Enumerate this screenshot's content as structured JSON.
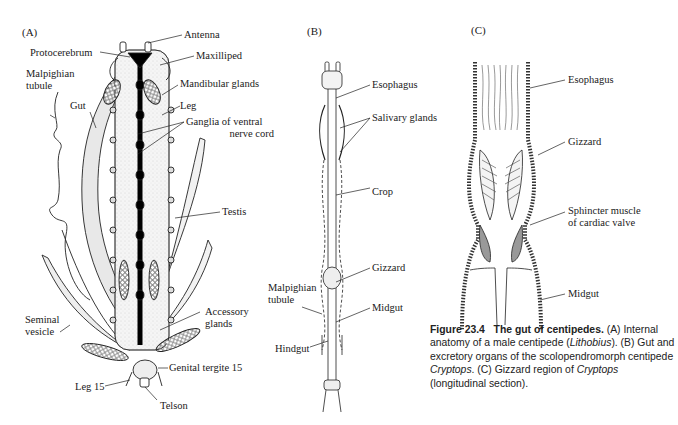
{
  "figure": {
    "panels": {
      "A": {
        "label": "(A)",
        "labels": {
          "antenna": "Antenna",
          "protocerebrum": "Protocerebrum",
          "maxilliped": "Maxilliped",
          "malpighian_1": "Malpighian",
          "malpighian_2": "tubule",
          "mandibular_glands": "Mandibular glands",
          "gut": "Gut",
          "leg": "Leg",
          "ganglia_1": "Ganglia of ventral",
          "ganglia_2": "nerve cord",
          "testis": "Testis",
          "accessory_1": "Accessory",
          "accessory_2": "glands",
          "seminal_1": "Seminal",
          "seminal_2": "vesicle",
          "genital_tergite": "Genital tergite 15",
          "leg15": "Leg 15",
          "telson": "Telson"
        }
      },
      "B": {
        "label": "(B)",
        "labels": {
          "esophagus": "Esophagus",
          "salivary_glands": "Salivary glands",
          "crop": "Crop",
          "gizzard": "Gizzard",
          "malpighian_1": "Malpighian",
          "malpighian_2": "tubule",
          "midgut": "Midgut",
          "hindgut": "Hindgut"
        }
      },
      "C": {
        "label": "(C)",
        "labels": {
          "esophagus": "Esophagus",
          "gizzard": "Gizzard",
          "sphincter_1": "Sphincter muscle",
          "sphincter_2": "of cardiac valve",
          "midgut": "Midgut"
        }
      }
    },
    "caption": {
      "number": "Figure 23.4",
      "title": "The gut of centipedes.",
      "part1": " (A) Internal anatomy of a male centipede (",
      "genus1": "Lithobius",
      "part2": "). (B) Gut and excretory organs of the scolopendromorph centipede ",
      "genus2": "Cryptops",
      "part3": ". (C) Gizzard region of ",
      "genus3": "Cryptops",
      "part4": " (longitudinal section)."
    }
  }
}
